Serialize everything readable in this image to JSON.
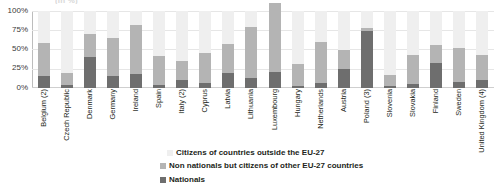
{
  "ghost_title": "(in %)",
  "axis": {
    "y_ticks": [
      "100%",
      "75%",
      "50%",
      "25%",
      "0%"
    ],
    "y_min": 0,
    "y_max": 100
  },
  "legend": {
    "items": [
      {
        "label": "Citizens of countries outside the EU-27",
        "color": "#efefef",
        "key": "outside_eu"
      },
      {
        "label": "Non nationals but citizens of other EU-27 countries",
        "color": "#b4b4b4",
        "key": "non_nationals_eu"
      },
      {
        "label": "Nationals",
        "color": "#6e6e6e",
        "key": "nationals"
      }
    ]
  },
  "chart_data": {
    "type": "bar",
    "title": "",
    "subtitle": "",
    "xlabel": "",
    "ylabel": "",
    "ylim": [
      0,
      100
    ],
    "grid": true,
    "stacked": true,
    "legend_position": "bottom",
    "y_tick_labels": [
      "0%",
      "25%",
      "50%",
      "75%",
      "100%"
    ],
    "categories": [
      "Belgium (2)",
      "Czech Republic",
      "Denmark",
      "Germany",
      "Ireland",
      "Spain",
      "Italy (2)",
      "Cyprus",
      "Latvia",
      "Lithuania",
      "Luxembourg",
      "Hungary",
      "Netherlands",
      "Austria",
      "Poland (3)",
      "Slovenia",
      "Slovakia",
      "Finland",
      "Sweden",
      "United Kingdom (4)"
    ],
    "series": [
      {
        "name": "Nationals",
        "color": "#6e6e6e",
        "values": [
          16,
          4,
          40,
          16,
          18,
          4,
          11,
          7,
          19,
          13,
          21,
          3,
          6,
          25,
          74,
          2,
          5,
          33,
          8,
          10
        ]
      },
      {
        "name": "Non nationals but citizens of other EU-27 countries",
        "color": "#b4b4b4",
        "values": [
          43,
          15,
          30,
          49,
          64,
          38,
          24,
          39,
          38,
          66,
          90,
          28,
          54,
          25,
          4,
          15,
          38,
          23,
          44,
          33
        ]
      },
      {
        "name": "Citizens of countries outside the EU-27",
        "color": "#efefef",
        "values": [
          41,
          81,
          30,
          35,
          18,
          58,
          65,
          54,
          43,
          21,
          0,
          69,
          40,
          50,
          22,
          83,
          57,
          44,
          48,
          57
        ]
      }
    ]
  }
}
